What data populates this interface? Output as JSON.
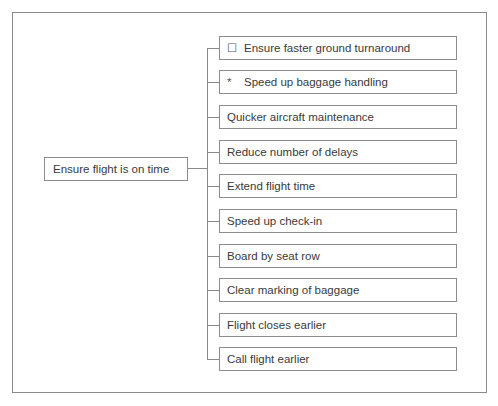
{
  "diagram": {
    "type": "tree",
    "root": {
      "label": "Ensure flight is on time"
    },
    "children": [
      {
        "label": "Ensure faster ground turnaround",
        "marker": "☐",
        "marker_name": "checkbox-icon"
      },
      {
        "label": "Speed up baggage handling",
        "marker": "*",
        "marker_name": "asterisk-icon"
      },
      {
        "label": "Quicker aircraft maintenance"
      },
      {
        "label": "Reduce number of delays"
      },
      {
        "label": "Extend flight time"
      },
      {
        "label": "Speed up check-in"
      },
      {
        "label": "Board by seat row"
      },
      {
        "label": "Clear marking of baggage"
      },
      {
        "label": "Flight closes earlier"
      },
      {
        "label": "Call flight earlier"
      }
    ],
    "colors": {
      "border": "#8a8a8a",
      "text": "#3a3a3a",
      "background": "#ffffff"
    }
  }
}
